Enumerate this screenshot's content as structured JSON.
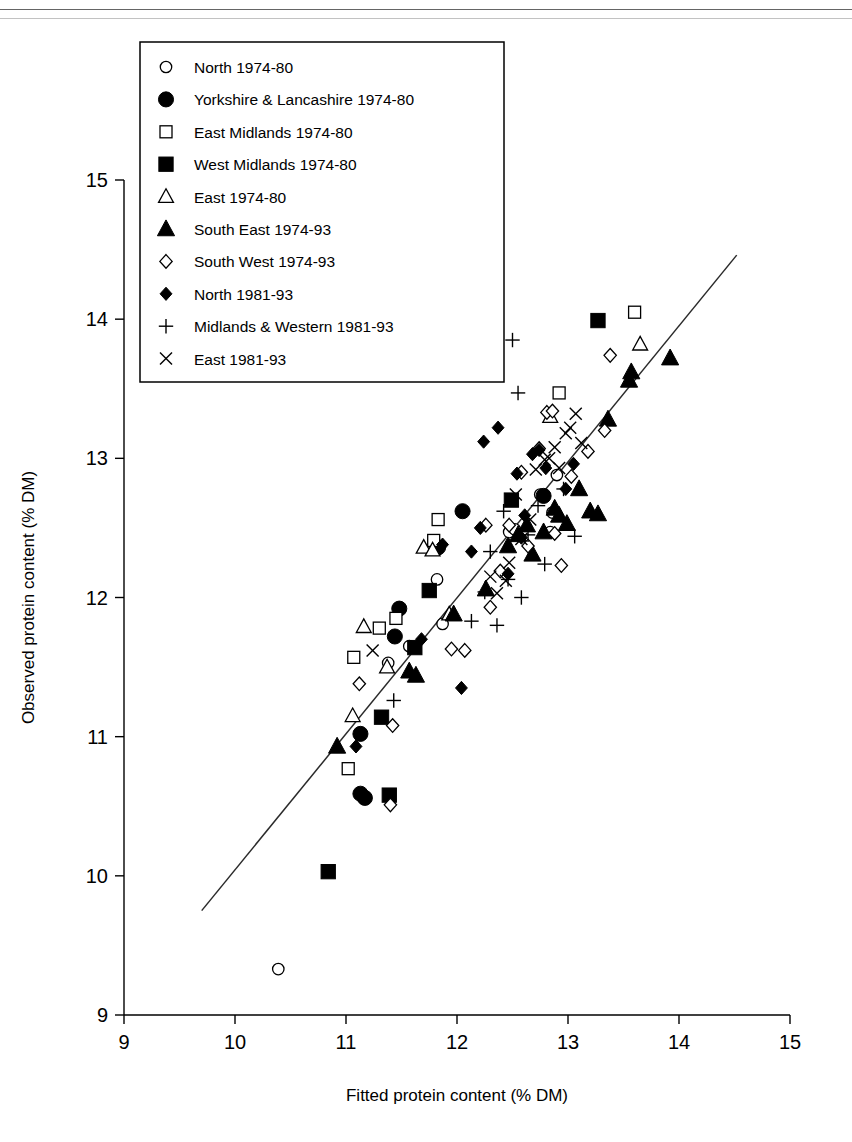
{
  "chart_data": {
    "type": "scatter",
    "title": "",
    "xlabel": "Fitted protein content (% DM)",
    "ylabel": "Observed protein content (% DM)",
    "xlim": [
      9,
      15
    ],
    "ylim": [
      9,
      15
    ],
    "xticks": [
      9,
      10,
      11,
      12,
      13,
      14,
      15
    ],
    "yticks": [
      9,
      10,
      11,
      12,
      13,
      14,
      15
    ],
    "grid": false,
    "legend_position": "top-left",
    "reference_line": {
      "name": "1:1 fitted line",
      "x": [
        9.7,
        14.52
      ],
      "y": [
        9.75,
        14.46
      ]
    },
    "series": [
      {
        "name": "North 1974-80",
        "marker": "open-circle",
        "points": [
          [
            10.39,
            9.33
          ],
          [
            11.38,
            11.53
          ],
          [
            11.57,
            11.65
          ],
          [
            11.82,
            12.13
          ],
          [
            11.87,
            11.81
          ],
          [
            12.47,
            12.47
          ],
          [
            12.52,
            12.49
          ],
          [
            12.75,
            12.74
          ],
          [
            12.84,
            12.47
          ],
          [
            12.86,
            12.61
          ],
          [
            12.9,
            12.88
          ]
        ]
      },
      {
        "name": "Yorkshire & Lancashire 1974-80",
        "marker": "filled-circle",
        "points": [
          [
            11.13,
            10.59
          ],
          [
            11.17,
            10.56
          ],
          [
            11.13,
            11.02
          ],
          [
            11.48,
            11.92
          ],
          [
            11.44,
            11.72
          ],
          [
            11.83,
            12.36
          ],
          [
            12.05,
            12.62
          ],
          [
            12.78,
            12.73
          ]
        ]
      },
      {
        "name": "East Midlands 1974-80",
        "marker": "open-square",
        "points": [
          [
            11.02,
            10.77
          ],
          [
            11.07,
            11.57
          ],
          [
            11.3,
            11.78
          ],
          [
            11.45,
            11.85
          ],
          [
            11.79,
            12.41
          ],
          [
            11.83,
            12.56
          ],
          [
            12.92,
            13.47
          ],
          [
            13.6,
            14.05
          ]
        ]
      },
      {
        "name": "West Midlands 1974-80",
        "marker": "filled-square",
        "points": [
          [
            10.84,
            10.03
          ],
          [
            11.39,
            10.58
          ],
          [
            11.32,
            11.14
          ],
          [
            11.75,
            12.05
          ],
          [
            11.62,
            11.64
          ],
          [
            12.49,
            12.7
          ],
          [
            13.27,
            13.99
          ]
        ]
      },
      {
        "name": "East 1974-80",
        "marker": "open-triangle",
        "points": [
          [
            11.06,
            11.15
          ],
          [
            11.16,
            11.79
          ],
          [
            11.37,
            11.5
          ],
          [
            11.7,
            12.36
          ],
          [
            11.78,
            12.34
          ],
          [
            11.93,
            11.88
          ],
          [
            12.84,
            13.3
          ],
          [
            13.65,
            13.82
          ]
        ]
      },
      {
        "name": "South East 1974-93",
        "marker": "filled-triangle",
        "points": [
          [
            10.92,
            10.93
          ],
          [
            11.57,
            11.47
          ],
          [
            11.63,
            11.44
          ],
          [
            11.97,
            11.88
          ],
          [
            12.26,
            12.06
          ],
          [
            12.46,
            12.37
          ],
          [
            12.55,
            12.45
          ],
          [
            12.63,
            12.52
          ],
          [
            12.68,
            12.31
          ],
          [
            12.78,
            12.47
          ],
          [
            12.92,
            12.59
          ],
          [
            12.99,
            12.53
          ],
          [
            13.1,
            12.78
          ],
          [
            13.2,
            12.62
          ],
          [
            13.27,
            12.6
          ],
          [
            13.55,
            13.56
          ],
          [
            13.57,
            13.62
          ],
          [
            13.36,
            13.28
          ],
          [
            13.92,
            13.72
          ],
          [
            12.88,
            12.64
          ]
        ]
      },
      {
        "name": "South West 1974-93",
        "marker": "open-diamond",
        "points": [
          [
            11.4,
            10.51
          ],
          [
            11.12,
            11.38
          ],
          [
            11.42,
            11.08
          ],
          [
            11.95,
            11.63
          ],
          [
            12.07,
            11.62
          ],
          [
            12.3,
            11.93
          ],
          [
            12.39,
            12.19
          ],
          [
            12.47,
            12.52
          ],
          [
            12.58,
            12.9
          ],
          [
            12.64,
            12.37
          ],
          [
            12.74,
            13.07
          ],
          [
            12.81,
            13.33
          ],
          [
            12.86,
            13.34
          ],
          [
            12.94,
            12.23
          ],
          [
            13.03,
            12.87
          ],
          [
            13.18,
            13.05
          ],
          [
            13.33,
            13.2
          ],
          [
            13.38,
            13.74
          ],
          [
            12.26,
            12.52
          ],
          [
            12.88,
            12.46
          ]
        ]
      },
      {
        "name": "North 1981-93",
        "marker": "filled-diamond",
        "points": [
          [
            11.09,
            10.93
          ],
          [
            11.68,
            11.7
          ],
          [
            11.87,
            12.38
          ],
          [
            12.04,
            11.35
          ],
          [
            12.21,
            12.5
          ],
          [
            12.24,
            13.12
          ],
          [
            12.37,
            13.22
          ],
          [
            12.46,
            12.17
          ],
          [
            12.54,
            12.89
          ],
          [
            12.61,
            12.59
          ],
          [
            12.68,
            13.03
          ],
          [
            12.74,
            13.06
          ],
          [
            12.8,
            12.93
          ],
          [
            12.98,
            12.78
          ],
          [
            13.05,
            12.96
          ],
          [
            12.13,
            12.33
          ],
          [
            12.58,
            12.43
          ]
        ]
      },
      {
        "name": "Midlands & Western 1981-93",
        "marker": "plus",
        "points": [
          [
            11.43,
            11.26
          ],
          [
            12.13,
            11.83
          ],
          [
            12.25,
            12.04
          ],
          [
            12.3,
            12.33
          ],
          [
            12.36,
            11.8
          ],
          [
            12.42,
            12.62
          ],
          [
            12.5,
            13.85
          ],
          [
            12.55,
            13.47
          ],
          [
            12.64,
            12.45
          ],
          [
            12.73,
            12.66
          ],
          [
            12.79,
            12.24
          ],
          [
            12.96,
            12.78
          ],
          [
            13.06,
            12.44
          ],
          [
            12.46,
            12.13
          ],
          [
            12.58,
            12.0
          ]
        ]
      },
      {
        "name": "East 1981-93",
        "marker": "cross",
        "points": [
          [
            11.24,
            11.62
          ],
          [
            12.3,
            12.15
          ],
          [
            12.36,
            12.03
          ],
          [
            12.44,
            12.12
          ],
          [
            12.53,
            12.74
          ],
          [
            12.58,
            12.42
          ],
          [
            12.71,
            12.92
          ],
          [
            12.79,
            12.99
          ],
          [
            12.83,
            13.0
          ],
          [
            12.88,
            13.08
          ],
          [
            12.92,
            12.93
          ],
          [
            12.98,
            13.18
          ],
          [
            13.02,
            13.22
          ],
          [
            13.07,
            13.32
          ],
          [
            13.12,
            13.11
          ],
          [
            12.66,
            12.56
          ],
          [
            12.47,
            12.25
          ]
        ]
      }
    ]
  },
  "legend": {
    "items": [
      {
        "label": "North 1974-80",
        "marker": "open-circle"
      },
      {
        "label": "Yorkshire & Lancashire 1974-80",
        "marker": "filled-circle"
      },
      {
        "label": "East Midlands 1974-80",
        "marker": "open-square"
      },
      {
        "label": "West Midlands 1974-80",
        "marker": "filled-square"
      },
      {
        "label": "East 1974-80",
        "marker": "open-triangle"
      },
      {
        "label": "South East 1974-93",
        "marker": "filled-triangle"
      },
      {
        "label": "South West 1974-93",
        "marker": "open-diamond"
      },
      {
        "label": "North 1981-93",
        "marker": "filled-diamond"
      },
      {
        "label": "Midlands & Western 1981-93",
        "marker": "plus"
      },
      {
        "label": "East 1981-93",
        "marker": "cross"
      }
    ]
  },
  "axes": {
    "x_title": "Fitted protein content (% DM)",
    "y_title": "Observed protein content (% DM)",
    "x_tick_labels": [
      "9",
      "10",
      "11",
      "12",
      "13",
      "14",
      "15"
    ],
    "y_tick_labels": [
      "9",
      "10",
      "11",
      "12",
      "13",
      "14",
      "15"
    ]
  },
  "colors": {
    "marker": "#000000",
    "axis": "#000000",
    "line": "#2a2a2a",
    "background": "#ffffff"
  }
}
